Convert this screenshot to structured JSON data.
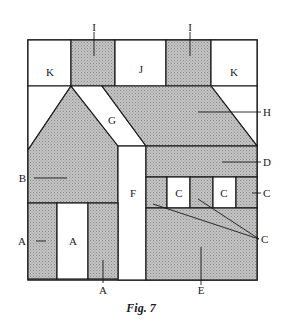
{
  "figure": {
    "caption": "Fig. 7",
    "colors": {
      "shaded": "#bdbdbd",
      "white": "#ffffff",
      "line": "#1a1a1a"
    },
    "labels": {
      "K_left": "K",
      "I_left": "I",
      "J": "J",
      "I_right": "I",
      "K_right": "K",
      "G": "G",
      "H": "H",
      "B": "B",
      "D": "D",
      "F": "F",
      "C_window1": "C",
      "C_window2": "C",
      "C_right": "C",
      "C_pointer": "C",
      "A_left": "A",
      "A_middle": "A",
      "A_bottom": "A",
      "E": "E"
    }
  }
}
